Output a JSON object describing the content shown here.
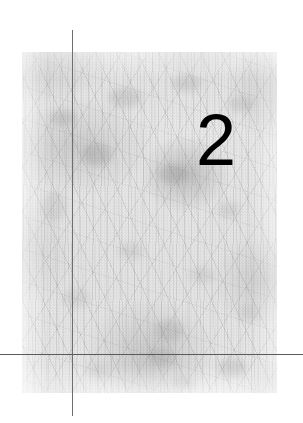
{
  "page": {
    "kind": "chapter-opener",
    "background_color": "#ffffff",
    "width": 303,
    "height": 423
  },
  "chapter": {
    "number": "2"
  },
  "texture_panel": {
    "label": "fibrous grey textured background image",
    "base_color": "#e4e4e4",
    "shade_color": "#8c8c8c",
    "x": 22,
    "y": 52,
    "width": 255,
    "height": 341,
    "blobs": [
      {
        "x": 28,
        "y": 58,
        "w": 26,
        "h": 16,
        "o": 0.26
      },
      {
        "x": 86,
        "y": 36,
        "w": 34,
        "h": 20,
        "o": 0.24
      },
      {
        "x": 150,
        "y": 22,
        "w": 30,
        "h": 18,
        "o": 0.22
      },
      {
        "x": 206,
        "y": 44,
        "w": 26,
        "h": 16,
        "o": 0.2
      },
      {
        "x": 60,
        "y": 92,
        "w": 30,
        "h": 22,
        "o": 0.3
      },
      {
        "x": 136,
        "y": 112,
        "w": 28,
        "h": 20,
        "o": 0.28
      },
      {
        "x": 20,
        "y": 140,
        "w": 24,
        "h": 30,
        "o": 0.18
      },
      {
        "x": 196,
        "y": 150,
        "w": 22,
        "h": 16,
        "o": 0.18
      },
      {
        "x": 96,
        "y": 190,
        "w": 26,
        "h": 18,
        "o": 0.16
      },
      {
        "x": 168,
        "y": 214,
        "w": 24,
        "h": 18,
        "o": 0.16
      },
      {
        "x": 40,
        "y": 236,
        "w": 28,
        "h": 20,
        "o": 0.15
      },
      {
        "x": 132,
        "y": 268,
        "w": 30,
        "h": 22,
        "o": 0.24
      },
      {
        "x": 216,
        "y": 252,
        "w": 22,
        "h": 18,
        "o": 0.16
      },
      {
        "x": 128,
        "y": 296,
        "w": 26,
        "h": 18,
        "o": 0.22
      },
      {
        "x": 196,
        "y": 306,
        "w": 28,
        "h": 20,
        "o": 0.22
      },
      {
        "x": 64,
        "y": 312,
        "w": 24,
        "h": 16,
        "o": 0.14
      },
      {
        "x": 150,
        "y": 324,
        "w": 22,
        "h": 14,
        "o": 0.18
      }
    ]
  },
  "rules": {
    "vertical": {
      "color": "#6e6e6e",
      "x": 72,
      "y": 30,
      "length": 386
    },
    "horizontal": {
      "color": "#5a5a5a",
      "x": 0,
      "y": 354,
      "length": 303
    }
  }
}
